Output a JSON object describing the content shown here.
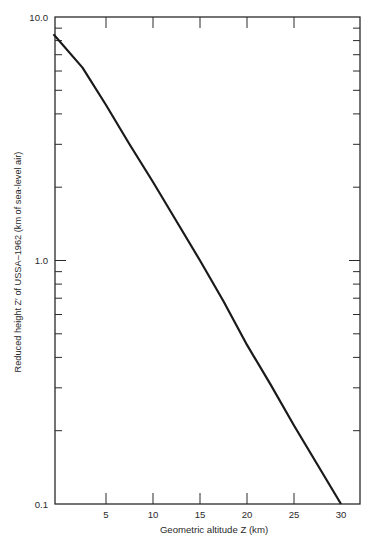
{
  "chart_data": {
    "type": "line",
    "title": "",
    "xlabel": "Geometric altitude Z (km)",
    "ylabel": "Reduced height Z′ of USSA–1962 (km of sea-level air)",
    "xlim": [
      0,
      32
    ],
    "ylim": [
      0.1,
      10.0
    ],
    "yscale": "log",
    "grid": false,
    "legend": null,
    "x_ticks": [
      5,
      10,
      15,
      20,
      25,
      30
    ],
    "x_tick_labels": [
      "5",
      "10",
      "15",
      "20",
      "25",
      "30"
    ],
    "y_ticks": [
      0.1,
      1.0,
      10.0
    ],
    "y_tick_labels": [
      "0.1",
      "1.0",
      "10.0"
    ],
    "y_minor_ticks": [
      0.2,
      0.3,
      0.4,
      0.5,
      0.6,
      0.7,
      0.8,
      0.9,
      2,
      3,
      4,
      5,
      6,
      7,
      8,
      9
    ],
    "series": [
      {
        "name": "Reduced height Z′",
        "color": "#1a1a1a",
        "x": [
          0,
          2.5,
          5,
          7.5,
          10,
          12.5,
          15,
          17.5,
          20,
          22.5,
          25,
          27.5,
          30
        ],
        "values": [
          8.5,
          6.2,
          4.35,
          3.0,
          2.1,
          1.45,
          1.0,
          0.68,
          0.45,
          0.31,
          0.21,
          0.145,
          0.1
        ]
      }
    ]
  }
}
